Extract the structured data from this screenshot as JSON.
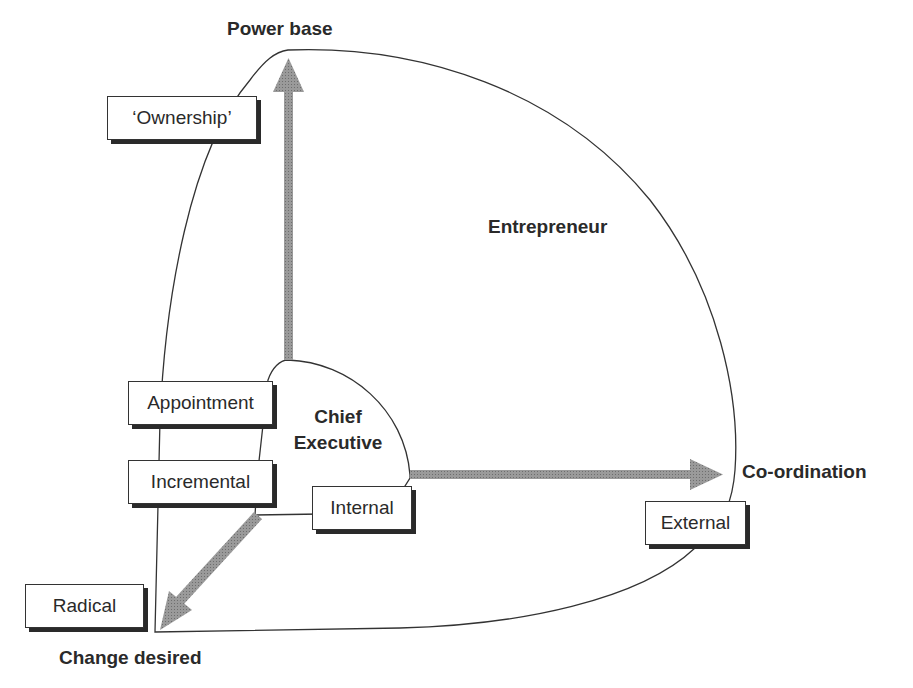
{
  "diagram": {
    "axes": {
      "power_base": "Power base",
      "coordination": "Co-ordination",
      "change_desired": "Change desired"
    },
    "regions": {
      "entrepreneur": "Entrepreneur",
      "chief_executive_line1": "Chief",
      "chief_executive_line2": "Executive"
    },
    "boxes": {
      "ownership": "‘Ownership’",
      "appointment": "Appointment",
      "incremental": "Incremental",
      "internal": "Internal",
      "external": "External",
      "radical": "Radical"
    },
    "colors": {
      "arrow": "#8c8c8c",
      "line": "#333333",
      "text": "#2a2a2a",
      "shadow": "#2a2a2a"
    }
  }
}
